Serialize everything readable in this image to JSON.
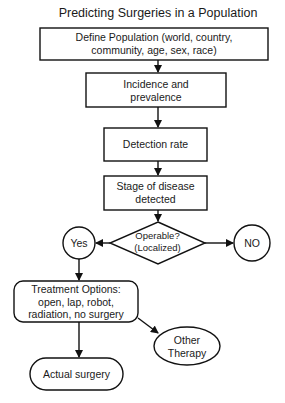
{
  "title": "Predicting Surgeries in a Population",
  "nodes": {
    "define_population": {
      "shape": "rectangle",
      "line1": "Define Population (world, country,",
      "line2": "community, age, sex, race)"
    },
    "incidence": {
      "shape": "rectangle",
      "line1": "Incidence and",
      "line2": "prevalence"
    },
    "detection": {
      "shape": "rectangle",
      "line1": "Detection rate"
    },
    "stage": {
      "shape": "rectangle",
      "line1": "Stage of disease",
      "line2": "detected"
    },
    "operable": {
      "shape": "diamond",
      "line1": "Operable?",
      "line2": "(Localized)"
    },
    "yes": {
      "shape": "circle",
      "line1": "Yes"
    },
    "no": {
      "shape": "circle",
      "line1": "NO"
    },
    "treatment": {
      "shape": "rounded-rectangle",
      "line1": "Treatment Options:",
      "line2": "open, lap, robot,",
      "line3": "radiation, no surgery"
    },
    "other_therapy": {
      "shape": "ellipse",
      "line1": "Other",
      "line2": "Therapy"
    },
    "actual_surgery": {
      "shape": "pill",
      "line1": "Actual surgery"
    }
  },
  "edges": [
    {
      "from": "define_population",
      "to": "incidence"
    },
    {
      "from": "incidence",
      "to": "detection"
    },
    {
      "from": "detection",
      "to": "stage"
    },
    {
      "from": "stage",
      "to": "operable"
    },
    {
      "from": "operable",
      "to": "yes"
    },
    {
      "from": "operable",
      "to": "no"
    },
    {
      "from": "yes",
      "to": "treatment"
    },
    {
      "from": "treatment",
      "to": "other_therapy"
    },
    {
      "from": "treatment",
      "to": "actual_surgery"
    }
  ],
  "colors": {
    "stroke": "#111111",
    "fill": "#ffffff",
    "text": "#1a1a1a"
  }
}
